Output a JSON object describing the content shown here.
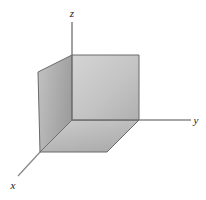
{
  "figure": {
    "background_color": "#ffffff",
    "width": 206,
    "height": 200
  },
  "axes": {
    "origin": {
      "x": 138,
      "y": 120
    },
    "line_color": "#808080",
    "items": [
      {
        "name": "z",
        "label": "z",
        "label_x": 72,
        "label_y": 17,
        "from": {
          "x": 72,
          "y": 55
        },
        "to": {
          "x": 72,
          "y": 22
        }
      },
      {
        "name": "y",
        "label": "y",
        "label_x": 196,
        "label_y": 124,
        "from": {
          "x": 139,
          "y": 120
        },
        "to": {
          "x": 191,
          "y": 120
        }
      },
      {
        "name": "x",
        "label": "x",
        "label_x": 13,
        "label_y": 188,
        "from": {
          "x": 40,
          "y": 152
        },
        "to": {
          "x": 18,
          "y": 175
        }
      }
    ]
  },
  "box": {
    "edge_color": "#5a5a5a",
    "faces": [
      {
        "name": "front-face",
        "points": "72,55 139,55 139,120 72,120",
        "fill_start": "#cfcfcf",
        "fill_end": "#b4b4b4"
      },
      {
        "name": "left-face",
        "points": "38,72 72,55 72,120 40,152",
        "fill_start": "#bdbdbd",
        "fill_end": "#a0a0a0"
      },
      {
        "name": "bottom-face",
        "points": "40,152 72,120 139,120 107,152",
        "fill_start": "#c6c6c6",
        "fill_end": "#aeaeae"
      }
    ]
  },
  "colors": {
    "axis": "#808080",
    "edge": "#5a5a5a",
    "label": "#1a1a1a",
    "page_background": "#ffffff"
  }
}
